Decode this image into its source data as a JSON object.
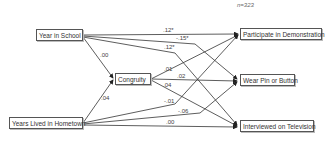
{
  "sample_size": "n=323",
  "nodes": {
    "year_in_school": "Year in School",
    "years_lived_in_hometown": "Years Lived in Hometown",
    "congruity": "Congruity",
    "participate_in_demonstration": "Participate in Demonstration",
    "wear_pin_or_button": "Wear Pin or Button",
    "interviewed_on_television": "Interviewed on Television"
  },
  "paths": [
    {
      "from": "Year in School",
      "to": "Congruity",
      "coef": ".00"
    },
    {
      "from": "Years Lived in Hometown",
      "to": "Congruity",
      "coef": ".04"
    },
    {
      "from": "Year in School",
      "to": "Participate in Demonstration",
      "coef": ".12*"
    },
    {
      "from": "Year in School",
      "to": "Wear Pin or Button",
      "coef": ".15*"
    },
    {
      "from": "Year in School",
      "to": "Interviewed on Television",
      "coef": ".12*"
    },
    {
      "from": "Congruity",
      "to": "Participate in Demonstration",
      "coef": ".01"
    },
    {
      "from": "Congruity",
      "to": "Wear Pin or Button",
      "coef": ".02"
    },
    {
      "from": "Congruity",
      "to": "Interviewed on Television",
      "coef": ".04"
    },
    {
      "from": "Years Lived in Hometown",
      "to": "Participate in Demonstration",
      "coef": "-.01"
    },
    {
      "from": "Years Lived in Hometown",
      "to": "Wear Pin or Button",
      "coef": "-.06"
    },
    {
      "from": "Years Lived in Hometown",
      "to": "Interviewed on Television",
      "coef": ".00"
    }
  ],
  "labels": {
    "c_ys_cong": ".00",
    "c_yh_cong": ".04",
    "c_ys_pd": ".12*",
    "c_ys_wp": "-.15*",
    "c_ys_tv": ".12*",
    "c_cg_pd": ".01",
    "c_cg_wp": ".02",
    "c_cg_tv": ".04",
    "c_yh_pd": "-.01",
    "c_yh_wp": "-.06",
    "c_yh_tv": ".00"
  }
}
